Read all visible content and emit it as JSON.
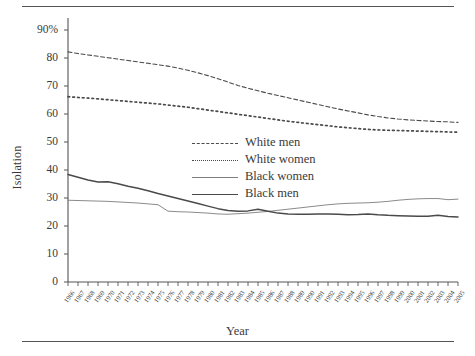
{
  "figure": {
    "ylabel": "Isolation",
    "xlabel": "Year"
  },
  "chart_data": {
    "type": "line",
    "title": "",
    "xlabel": "Year",
    "ylabel": "Isolation",
    "ylim": [
      0,
      90
    ],
    "yticks": [
      0,
      10,
      20,
      30,
      40,
      50,
      60,
      70,
      80,
      90
    ],
    "ytick_labels": [
      "0",
      "10",
      "20",
      "30",
      "40",
      "50",
      "60",
      "70",
      "80",
      "90%"
    ],
    "grid": false,
    "legend_position": "center",
    "categories": [
      "1966",
      "1967",
      "1968",
      "1969",
      "1970",
      "1971",
      "1972",
      "1973",
      "1974",
      "1975",
      "1976",
      "1977",
      "1978",
      "1979",
      "1980",
      "1981",
      "1982",
      "1983",
      "1984",
      "1985",
      "1986",
      "1987",
      "1988",
      "1989",
      "1990",
      "1991",
      "1992",
      "1993",
      "1994",
      "1995",
      "1996",
      "1997",
      "1998",
      "1999",
      "2000",
      "2001",
      "2002",
      "2003",
      "2004",
      "2005"
    ],
    "series": [
      {
        "name": "White men",
        "style": "dashed",
        "color": "#4a4a4a",
        "values": [
          82.2,
          81.6,
          81.1,
          80.6,
          80.1,
          79.6,
          79.1,
          78.6,
          78.1,
          77.6,
          77.1,
          76.4,
          75.6,
          74.7,
          73.7,
          72.6,
          71.4,
          70.2,
          69.2,
          68.3,
          67.4,
          66.6,
          65.8,
          65.0,
          64.2,
          63.4,
          62.6,
          61.8,
          61.1,
          60.4,
          59.7,
          59.1,
          58.6,
          58.2,
          57.9,
          57.7,
          57.5,
          57.3,
          57.2,
          57.0
        ]
      },
      {
        "name": "White women",
        "style": "dotted",
        "color": "#4a4a4a",
        "values": [
          66.2,
          65.9,
          65.7,
          65.4,
          65.1,
          64.8,
          64.5,
          64.2,
          63.9,
          63.6,
          63.2,
          62.8,
          62.4,
          61.9,
          61.4,
          60.9,
          60.4,
          59.9,
          59.4,
          58.9,
          58.4,
          57.9,
          57.4,
          57.0,
          56.6,
          56.2,
          55.8,
          55.4,
          55.1,
          54.8,
          54.5,
          54.3,
          54.2,
          54.1,
          54.0,
          53.9,
          53.8,
          53.7,
          53.6,
          53.5
        ]
      },
      {
        "name": "Black women",
        "style": "thin-solid",
        "color": "#7d7d7d",
        "values": [
          29.2,
          29.1,
          29.0,
          28.9,
          28.8,
          28.6,
          28.4,
          28.2,
          27.9,
          27.6,
          25.3,
          25.1,
          25.0,
          24.8,
          24.6,
          24.3,
          24.2,
          24.4,
          24.6,
          24.9,
          25.2,
          25.6,
          26.0,
          26.4,
          26.8,
          27.2,
          27.6,
          27.9,
          28.1,
          28.2,
          28.3,
          28.5,
          28.8,
          29.2,
          29.5,
          29.7,
          29.8,
          29.8,
          29.4,
          29.6
        ]
      },
      {
        "name": "Black men",
        "style": "thick-solid",
        "color": "#4a4a4a",
        "values": [
          38.4,
          37.4,
          36.4,
          35.7,
          35.8,
          35.1,
          34.2,
          33.5,
          32.6,
          31.6,
          30.7,
          29.8,
          28.9,
          28.0,
          27.1,
          26.2,
          25.5,
          25.3,
          25.4,
          26.0,
          25.3,
          24.6,
          24.3,
          24.2,
          24.2,
          24.3,
          24.3,
          24.2,
          24.0,
          24.1,
          24.3,
          24.0,
          23.8,
          23.7,
          23.6,
          23.5,
          23.5,
          23.8,
          23.4,
          23.2
        ]
      }
    ]
  },
  "legend": {
    "items": [
      {
        "label": "White men",
        "key": "dashed-line-key"
      },
      {
        "label": "White women",
        "key": "dotted-line-key"
      },
      {
        "label": "Black women",
        "key": "thin-solid-line-key"
      },
      {
        "label": "Black men",
        "key": "thick-solid-line-key"
      }
    ]
  }
}
